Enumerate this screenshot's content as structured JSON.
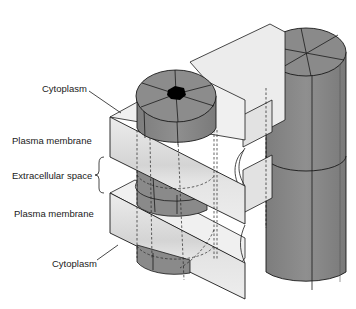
{
  "diagram": {
    "labels": {
      "cytoplasm_top": "Cytoplasm",
      "plasma_membrane_top": "Plasma membrane",
      "extracellular_space": "Extracellular space",
      "plasma_membrane_bottom": "Plasma membrane",
      "cytoplasm_bottom": "Cytoplasm"
    },
    "colors": {
      "membrane_face": "#e6e6e6",
      "membrane_band": "#d2d2d2",
      "connexon": "#8c8c8c",
      "connexon_dark": "#7a7a7a",
      "pore": "#000000",
      "outline": "#1a1a1a"
    }
  }
}
